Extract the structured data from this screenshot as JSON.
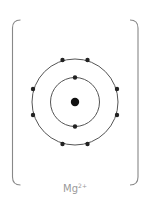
{
  "diagram": {
    "type": "electron-shell-diagram",
    "ion": {
      "symbol": "Mg",
      "charge": "2+"
    },
    "nucleus": {
      "cx": 75,
      "cy": 102,
      "r": 4.2
    },
    "shells": [
      {
        "name": "inner",
        "cx": 75,
        "cy": 102,
        "r": 24.5,
        "electrons": 2,
        "electron_positions": [
          [
            75,
            77.5
          ],
          [
            75,
            126.5
          ]
        ]
      },
      {
        "name": "outer",
        "cx": 75,
        "cy": 102,
        "r": 43,
        "electrons": 8,
        "electron_positions": [
          [
            62.5,
            60
          ],
          [
            87.5,
            60
          ],
          [
            33,
            89
          ],
          [
            117,
            89
          ],
          [
            33,
            115
          ],
          [
            117,
            115
          ],
          [
            62.5,
            144
          ],
          [
            87.5,
            144
          ]
        ]
      }
    ],
    "brackets": {
      "left_x": 12.5,
      "right_x": 138,
      "top_y": 20,
      "bottom_y": 185
    },
    "colors": {
      "stroke": "#555555",
      "electron": "#222222",
      "bracket": "#777777",
      "label": "#9a9a9a"
    }
  }
}
